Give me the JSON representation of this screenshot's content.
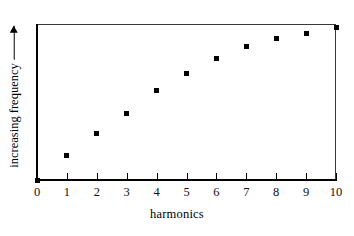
{
  "chart_data": {
    "type": "scatter",
    "title": "",
    "xlabel": "harmonics",
    "ylabel": "increasing frequency",
    "ylabel_arrow": "→",
    "x": [
      0,
      1,
      2,
      3,
      4,
      5,
      6,
      7,
      8,
      9,
      10
    ],
    "y": [
      0,
      0.16,
      0.3,
      0.43,
      0.58,
      0.69,
      0.79,
      0.87,
      0.92,
      0.95,
      0.99
    ],
    "xticks": [
      "0",
      "1",
      "2",
      "3",
      "4",
      "5",
      "6",
      "7",
      "8",
      "9",
      "10"
    ],
    "yticks": [],
    "xlim": [
      0,
      10
    ],
    "ylim": [
      0,
      1
    ],
    "grid": false,
    "legend": null,
    "marker": "square",
    "marker_color": "#000000",
    "frame_color": "#3a3a3a",
    "background": "#ffffff"
  },
  "axes": {
    "x_title": "harmonics",
    "y_title": "increasing frequency"
  }
}
